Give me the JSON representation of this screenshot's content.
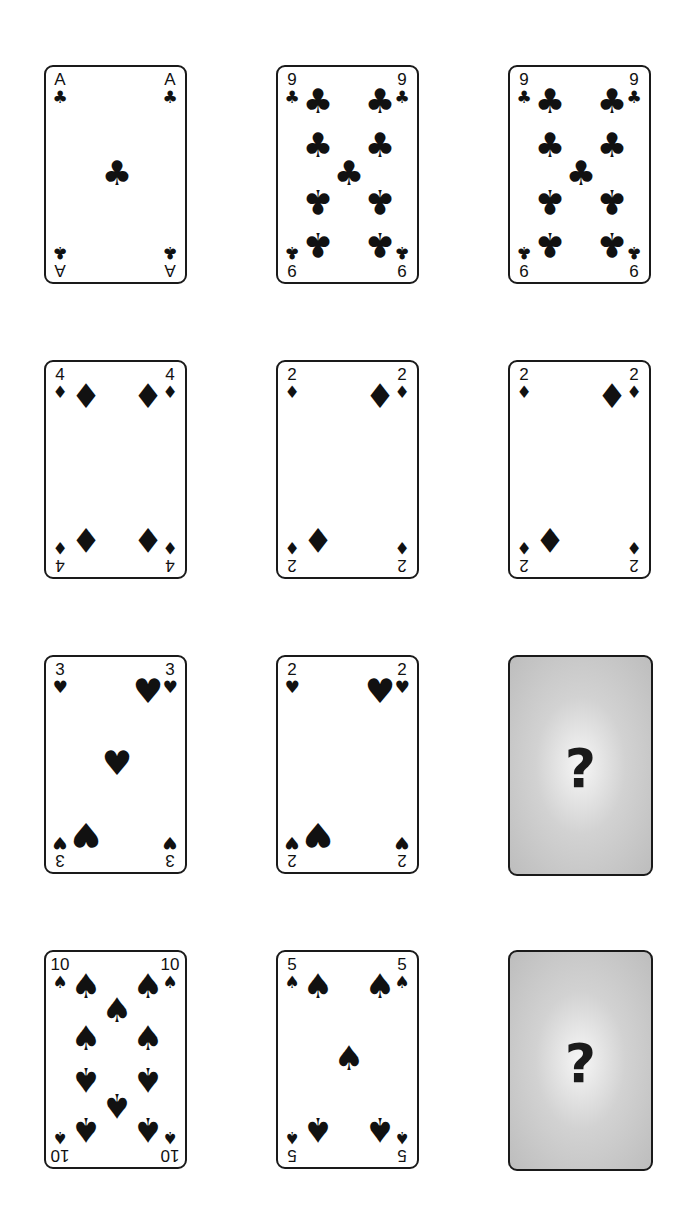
{
  "puzzle": {
    "type": "card-sequence-grid",
    "rows": 4,
    "cols": 3
  },
  "cards": [
    {
      "row": 0,
      "col": 0,
      "rank": "A",
      "suit": "clubs",
      "suit_glyph": "♣",
      "face_up": true
    },
    {
      "row": 0,
      "col": 1,
      "rank": "9",
      "suit": "clubs",
      "suit_glyph": "♣",
      "face_up": true
    },
    {
      "row": 0,
      "col": 2,
      "rank": "9",
      "suit": "clubs",
      "suit_glyph": "♣",
      "face_up": true
    },
    {
      "row": 1,
      "col": 0,
      "rank": "4",
      "suit": "diamonds",
      "suit_glyph": "♦",
      "face_up": true
    },
    {
      "row": 1,
      "col": 1,
      "rank": "2",
      "suit": "diamonds",
      "suit_glyph": "♦",
      "face_up": true
    },
    {
      "row": 1,
      "col": 2,
      "rank": "2",
      "suit": "diamonds",
      "suit_glyph": "♦",
      "face_up": true
    },
    {
      "row": 2,
      "col": 0,
      "rank": "3",
      "suit": "hearts",
      "suit_glyph": "♥",
      "face_up": true
    },
    {
      "row": 2,
      "col": 1,
      "rank": "2",
      "suit": "hearts",
      "suit_glyph": "♥",
      "face_up": true
    },
    {
      "row": 2,
      "col": 2,
      "rank": "?",
      "suit": "unknown",
      "face_up": false,
      "label": "?"
    },
    {
      "row": 3,
      "col": 0,
      "rank": "10",
      "suit": "spades",
      "suit_glyph": "♠",
      "face_up": true
    },
    {
      "row": 3,
      "col": 1,
      "rank": "5",
      "suit": "spades",
      "suit_glyph": "♠",
      "face_up": true
    },
    {
      "row": 3,
      "col": 2,
      "rank": "?",
      "suit": "unknown",
      "face_up": false,
      "label": "?"
    }
  ],
  "colors": {
    "card_border": "#1a1a1a",
    "card_face": "#ffffff",
    "card_back": "#c8c8c8",
    "ink": "#111111"
  }
}
